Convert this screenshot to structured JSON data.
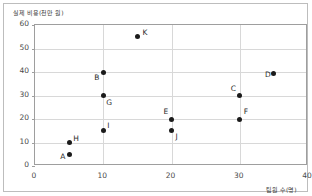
{
  "chart_data": {
    "type": "scatter",
    "title": "",
    "ylabel": "실제 비용(천만 원)",
    "xlabel": "팀원 수(명)",
    "xlim": [
      0,
      40
    ],
    "ylim": [
      0,
      60
    ],
    "xticks": [
      "0",
      "10",
      "20",
      "30",
      "40"
    ],
    "yticks": [
      "0",
      "10",
      "20",
      "30",
      "40",
      "50",
      "60"
    ],
    "grid": true,
    "legend": "none",
    "points": [
      {
        "label": "A",
        "x": 5,
        "y": 5,
        "lx": -9,
        "ly": -2
      },
      {
        "label": "H",
        "x": 5,
        "y": 10,
        "lx": 4,
        "ly": -9
      },
      {
        "label": "I",
        "x": 10,
        "y": 15,
        "lx": 4,
        "ly": -10
      },
      {
        "label": "G",
        "x": 10,
        "y": 30,
        "lx": 3,
        "ly": 2
      },
      {
        "label": "B",
        "x": 10,
        "y": 40,
        "lx": -9,
        "ly": 1
      },
      {
        "label": "K",
        "x": 15,
        "y": 55,
        "lx": 5,
        "ly": -9
      },
      {
        "label": "J",
        "x": 20,
        "y": 15,
        "lx": 4,
        "ly": 1
      },
      {
        "label": "E",
        "x": 20,
        "y": 20,
        "lx": -8,
        "ly": -12
      },
      {
        "label": "F",
        "x": 30,
        "y": 20,
        "lx": 4,
        "ly": -12
      },
      {
        "label": "C",
        "x": 30,
        "y": 30,
        "lx": -9,
        "ly": -12
      },
      {
        "label": "D",
        "x": 35,
        "y": 39.5,
        "lx": -9,
        "ly": -3
      }
    ]
  }
}
